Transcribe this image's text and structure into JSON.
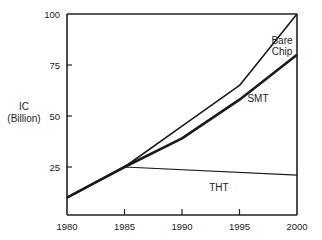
{
  "chart_data": {
    "type": "line",
    "title": "",
    "xlabel": "",
    "ylabel": "IC (Billion)",
    "ylabel_lines": [
      "IC",
      "(Billion)"
    ],
    "x": [
      1980,
      1985,
      1990,
      1995,
      2000
    ],
    "xticks": [
      "1980",
      "1985",
      "1990",
      "1995",
      "2000"
    ],
    "yticks": [
      "25",
      "50",
      "75",
      "100"
    ],
    "xlim": [
      1980,
      2000
    ],
    "ylim": [
      0,
      100
    ],
    "grid": false,
    "legend": "inline labels",
    "series": [
      {
        "name": "Bare Chip",
        "label_lines": [
          "Bare",
          "Chip"
        ],
        "x": [
          1980,
          1985,
          1990,
          1995,
          2000
        ],
        "values": [
          10,
          25,
          45,
          65,
          100
        ],
        "stroke": 1.6
      },
      {
        "name": "SMT",
        "label_lines": [
          "SMT"
        ],
        "x": [
          1980,
          1985,
          1990,
          1995,
          2000
        ],
        "values": [
          10,
          25,
          39,
          58,
          80
        ],
        "stroke": 2.6
      },
      {
        "name": "THT",
        "label_lines": [
          "THT"
        ],
        "x": [
          1980,
          1985,
          2000
        ],
        "values": [
          10,
          25,
          21
        ],
        "stroke": 1.2
      }
    ]
  }
}
